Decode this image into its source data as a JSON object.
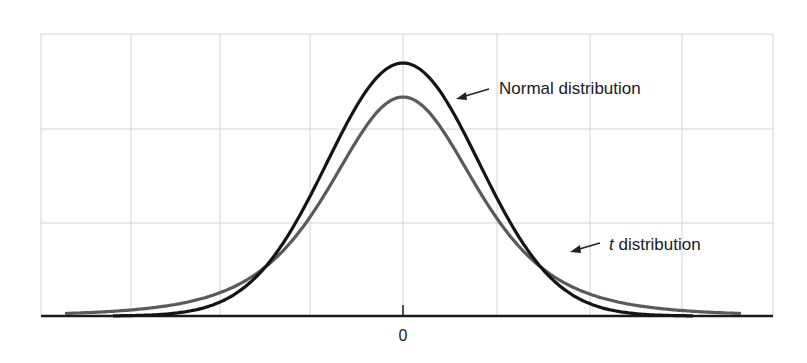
{
  "chart_data": {
    "type": "line",
    "title": "",
    "xlabel": "",
    "ylabel": "",
    "x_ticks": [
      {
        "value": 0,
        "label": "0"
      }
    ],
    "grid": true,
    "legend": "annotations",
    "series": [
      {
        "name": "Normal distribution",
        "label_text": "Normal distribution",
        "color": "#141414",
        "description": "standard normal density, taller peak, thinner tails",
        "peak_height_relative": 1.0,
        "x": [
          -3.5,
          -3,
          -2.5,
          -2,
          -1.5,
          -1,
          -0.5,
          0,
          0.5,
          1,
          1.5,
          2,
          2.5,
          3,
          3.5
        ],
        "values": [
          0.001,
          0.004,
          0.018,
          0.054,
          0.13,
          0.242,
          0.352,
          0.399,
          0.352,
          0.242,
          0.13,
          0.054,
          0.018,
          0.004,
          0.001
        ]
      },
      {
        "name": "t distribution",
        "label_italic_part": "t",
        "label_rest": " distribution",
        "color": "#5a5a5a",
        "description": "Student t density, lower peak, heavier tails",
        "peak_height_relative": 0.866,
        "x": [
          -3.5,
          -3,
          -2.5,
          -2,
          -1.5,
          -1,
          -0.5,
          0,
          0.5,
          1,
          1.5,
          2,
          2.5,
          3,
          3.5
        ],
        "values": [
          0.008,
          0.016,
          0.034,
          0.068,
          0.125,
          0.206,
          0.298,
          0.345,
          0.298,
          0.206,
          0.125,
          0.068,
          0.034,
          0.016,
          0.008
        ]
      }
    ],
    "annotations": [
      {
        "text": "Normal distribution",
        "points_to": "Normal distribution curve (right shoulder)"
      },
      {
        "text": "t distribution",
        "points_to": "t distribution curve (right tail)"
      }
    ]
  },
  "labels": {
    "normal": "Normal distribution",
    "t_italic": "t",
    "t_rest": " distribution",
    "zero": "0"
  },
  "layout": {
    "center_x": 403,
    "baseline_y": 316,
    "normal_peak_y": 63,
    "t_peak_y": 97,
    "px_per_unit": 76,
    "grid_x": [
      41,
      131,
      220,
      310,
      403,
      497,
      590,
      682,
      773
    ],
    "grid_y": [
      34,
      129,
      223
    ],
    "grid_left": 41,
    "grid_right": 773,
    "grid_top": 34
  }
}
